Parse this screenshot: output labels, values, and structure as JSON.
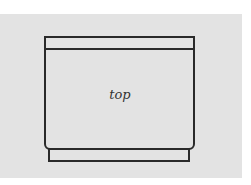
{
  "diagram": {
    "label": "top",
    "colors": {
      "background": "#e3e3e3",
      "stroke": "#2a2a2a"
    }
  }
}
